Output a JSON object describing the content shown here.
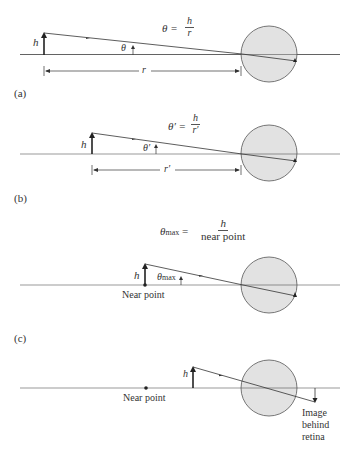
{
  "panels": [
    {
      "id": "a",
      "label": "(a)",
      "formula": {
        "lhs": "θ =",
        "num": "h",
        "den": "r"
      },
      "object_label": "h",
      "angle_label": "θ",
      "distance_label": "r"
    },
    {
      "id": "b",
      "label": "(b)",
      "formula": {
        "lhs": "θ′ =",
        "num": "h",
        "den": "r′"
      },
      "object_label": "h",
      "angle_label": "θ′",
      "distance_label": "r′"
    },
    {
      "id": "c",
      "label": "(c)",
      "formula": {
        "lhs": "θ",
        "lhs_sub": "max",
        "eq": "=",
        "num": "h",
        "den": "near point"
      },
      "object_label": "h",
      "angle_label": "θ",
      "angle_sub": "max",
      "point_label": "Near point"
    },
    {
      "id": "d",
      "object_label": "h",
      "point_label": "Near point",
      "image_label_lines": [
        "Image",
        "behind",
        "retina"
      ]
    }
  ],
  "colors": {
    "line": "#444444",
    "eye_fill": "#e2e2e2",
    "eye_stroke": "#555555"
  }
}
